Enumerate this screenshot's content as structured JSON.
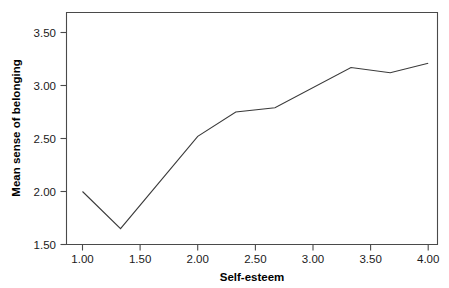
{
  "chart_data": {
    "type": "line",
    "title": "",
    "subtitle": "",
    "xlabel": "Self-esteem",
    "ylabel": "Mean sense of belonging",
    "xlim": [
      0.85,
      4.1
    ],
    "ylim": [
      1.42,
      3.68
    ],
    "grid": false,
    "legend": null,
    "xticks": [
      1.0,
      1.5,
      2.0,
      2.5,
      3.0,
      3.5,
      4.0
    ],
    "xtick_labels": [
      "1.00",
      "1.50",
      "2.00",
      "2.50",
      "3.00",
      "3.50",
      "4.00"
    ],
    "yticks": [
      1.5,
      2.0,
      2.5,
      3.0,
      3.5
    ],
    "ytick_labels": [
      "1.50",
      "2.00",
      "2.50",
      "3.00",
      "3.50"
    ],
    "x": [
      1.0,
      1.33,
      2.0,
      2.33,
      2.67,
      3.33,
      3.67,
      4.0
    ],
    "values": [
      2.0,
      1.65,
      2.52,
      2.75,
      2.79,
      3.17,
      3.12,
      3.21
    ],
    "series": [
      {
        "name": "Mean sense of belonging",
        "color": "#3a3a3a",
        "x": [
          1.0,
          1.33,
          2.0,
          2.33,
          2.67,
          3.33,
          3.67,
          4.0
        ],
        "values": [
          2.0,
          1.65,
          2.52,
          2.75,
          2.79,
          3.17,
          3.12,
          3.21
        ]
      }
    ]
  },
  "axes": {
    "x_title": "Self-esteem",
    "y_title": "Mean sense of belonging"
  },
  "colors": {
    "line": "#3a3a3a",
    "frame": "#4a4a4a",
    "text": "#000000",
    "background": "#ffffff"
  }
}
